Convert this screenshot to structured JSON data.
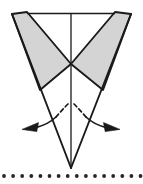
{
  "figure": {
    "background_color": "#ffffff",
    "stroke_color": "#1a1a1a",
    "shade_fill": "#d4d4d4",
    "dotted_line_color": "#262626",
    "canvas": {
      "width": 143,
      "height": 184
    }
  },
  "geometry": {
    "center_x": 71,
    "top_edge_y": 13.5,
    "cross_point": {
      "x": 71,
      "y": 64
    },
    "apex": {
      "x": 71,
      "y": 168
    },
    "left_wedge_outer_top": {
      "x": 12,
      "y": 14
    },
    "left_wedge_inner_top": {
      "x": 27,
      "y": 12
    },
    "right_wedge_inner_top": {
      "x": 115,
      "y": 12
    },
    "right_wedge_outer_top": {
      "x": 131,
      "y": 14
    },
    "left_flap_bottom_vertex": {
      "x": 40,
      "y": 90
    },
    "right_flap_bottom_vertex": {
      "x": 103,
      "y": 90
    }
  },
  "shapes": {
    "top_horizontal_edge": {
      "label": "Top horizontal fold edge",
      "from": {
        "x": 27,
        "y": 13.5
      },
      "to": {
        "x": 115,
        "y": 13.5
      }
    },
    "center_vertical_line": {
      "label": "Center vertical fold line",
      "from": {
        "x": 71,
        "y": 13.5
      },
      "to": {
        "x": 71,
        "y": 168
      }
    },
    "left_shaded_flap": {
      "label": "Left shaded triangular flap",
      "points": "12,14 27,12 71,64 40,90",
      "fill": "#d4d4d4"
    },
    "right_shaded_flap": {
      "label": "Right shaded triangular flap",
      "points": "131,14 115,12 71,64 103,90",
      "fill": "#d4d4d4"
    },
    "left_v_side": {
      "label": "Left outer V side",
      "from": {
        "x": 12,
        "y": 14
      },
      "to": {
        "x": 71,
        "y": 168
      }
    },
    "right_v_side": {
      "label": "Right outer V side",
      "from": {
        "x": 131,
        "y": 14
      },
      "to": {
        "x": 71,
        "y": 168
      }
    },
    "left_flap_lower_edge": {
      "label": "Left flap lower edge",
      "from": {
        "x": 40,
        "y": 90
      },
      "to": {
        "x": 71,
        "y": 64
      }
    },
    "right_flap_lower_edge": {
      "label": "Right flap lower edge",
      "from": {
        "x": 103,
        "y": 90
      },
      "to": {
        "x": 71,
        "y": 64
      }
    }
  },
  "annotations": {
    "left_rotation_arrow": {
      "label": "Left outward rotation arrow",
      "dashed_path": "M 68,104 Q 62,110 56,117",
      "solid_path": "M 56,117 Q 48,124 36,127",
      "arrow_tip": {
        "x": 22,
        "y": 129
      },
      "dash_pattern": "4,3"
    },
    "right_rotation_arrow": {
      "label": "Right outward rotation arrow",
      "dashed_path": "M 74,104 Q 80,110 86,117",
      "solid_path": "M 86,117 Q 94,124 106,127",
      "arrow_tip": {
        "x": 120,
        "y": 129
      },
      "dash_pattern": "4,3"
    },
    "dotted_guide_line": {
      "label": "Dotted horizontal guide line",
      "y": 176,
      "dot_radius": 1.9,
      "dot_count": 16,
      "start_x": 4,
      "spacing": 9.1
    }
  }
}
